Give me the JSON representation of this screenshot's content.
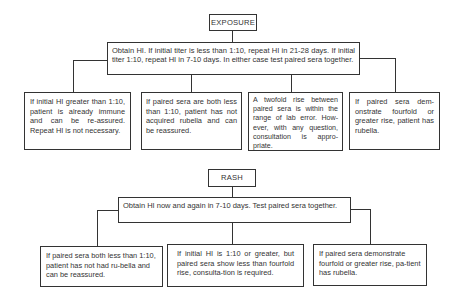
{
  "exposure": {
    "title": "EXPOSURE",
    "instruction": "Obtain HI. If initial titer is less than 1:10, repeat HI in 21-28 days. If initial titer 1:10, repeat HI in 7-10 days. In either case test paired sera together.",
    "outcomes": [
      "If initial HI greater than 1:10, patient is already immune and can be re-assured. Repeat HI is not necessary.",
      "If paired sera are both less than 1:10, patient has not acquired rubella and can be reassured.",
      "A twofold rise between paired sera is within the range of lab error. How-ever, with any question, consultation is appro-priate.",
      "If paired sera dem-onstrate fourfold or greater rise, patient has rubella."
    ]
  },
  "rash": {
    "title": "RASH",
    "instruction": "Obtain HI now and again in 7-10 days. Test paired sera together.",
    "outcomes": [
      "If paired sera both less than 1:10, patient has not had ru-bella and can be reassured.",
      "If initial HI is 1:10 or greater, but paired sera show less than fourfold rise, consulta-tion is required.",
      "If paired sera demonstrate fourfold or greater rise, pa-tient has rubella."
    ]
  }
}
